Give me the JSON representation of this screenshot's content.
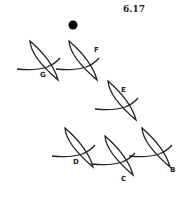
{
  "figure": {
    "number": "6.17",
    "dot": {
      "x": 73,
      "y": 25,
      "r": 4.5
    },
    "stroke_color": "#222222",
    "items": [
      {
        "label": "G",
        "cx": 43,
        "cy": 63,
        "lx": 40,
        "ly": 71
      },
      {
        "label": "F",
        "cx": 82,
        "cy": 63,
        "lx": 94,
        "ly": 46
      },
      {
        "label": "E",
        "cx": 121,
        "cy": 103,
        "lx": 121,
        "ly": 86
      },
      {
        "label": "D",
        "cx": 78,
        "cy": 150,
        "lx": 73,
        "ly": 158
      },
      {
        "label": "C",
        "cx": 118,
        "cy": 158,
        "lx": 121,
        "ly": 175
      },
      {
        "label": "B",
        "cx": 155,
        "cy": 150,
        "lx": 170,
        "ly": 166
      }
    ]
  }
}
